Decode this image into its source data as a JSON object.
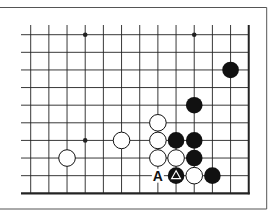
{
  "diagram": {
    "type": "go-board-fragment",
    "board_edges": [
      "right",
      "bottom"
    ],
    "columns": 13,
    "rows": 10,
    "geometry": {
      "x0": 30.7,
      "dx": 18.17,
      "y0": 34.7,
      "dy": 17.62,
      "line_top": 25,
      "line_left": 21,
      "stone_radius": 8.3
    },
    "frame": {
      "top_y": 7.5,
      "right_x": 266.7,
      "bottom_y": 209
    },
    "colors": {
      "line": "#222222",
      "black_stone": "#111111",
      "white_stone": "#ffffff",
      "frame": "#555555"
    },
    "star_points": [
      {
        "col": 3,
        "row": 0
      },
      {
        "col": 9,
        "row": 0
      },
      {
        "col": 3,
        "row": 6
      }
    ],
    "stones": [
      {
        "col": 11,
        "row": 2,
        "color": "black"
      },
      {
        "col": 9,
        "row": 4,
        "color": "black"
      },
      {
        "col": 7,
        "row": 5,
        "color": "white"
      },
      {
        "col": 5,
        "row": 6,
        "color": "white"
      },
      {
        "col": 7,
        "row": 6,
        "color": "white"
      },
      {
        "col": 8,
        "row": 6,
        "color": "black"
      },
      {
        "col": 9,
        "row": 6,
        "color": "black"
      },
      {
        "col": 2,
        "row": 7,
        "color": "white"
      },
      {
        "col": 7,
        "row": 7,
        "color": "white"
      },
      {
        "col": 8,
        "row": 7,
        "color": "white"
      },
      {
        "col": 9,
        "row": 7,
        "color": "black"
      },
      {
        "col": 8,
        "row": 8,
        "color": "black",
        "marker": "triangle"
      },
      {
        "col": 9,
        "row": 8,
        "color": "white"
      },
      {
        "col": 10,
        "row": 8,
        "color": "black"
      }
    ],
    "labels": [
      {
        "col": 7,
        "row": 8,
        "text": "A"
      }
    ]
  }
}
